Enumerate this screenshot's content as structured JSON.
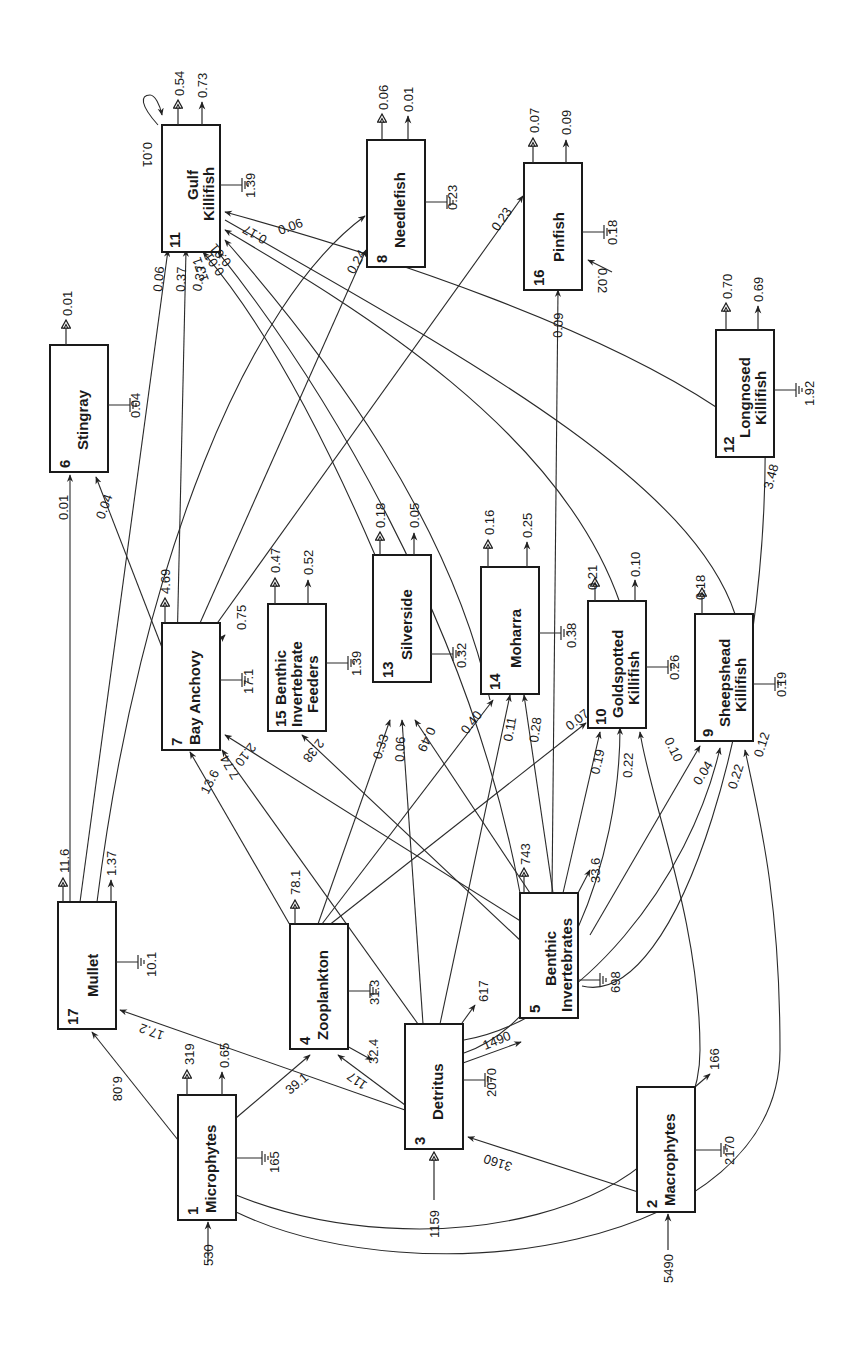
{
  "diagram": {
    "title": "",
    "orientation": "rotated -90deg",
    "compartments": [
      {
        "id": 1,
        "name": [
          "Microphytes"
        ],
        "import": "530",
        "export": "319",
        "other_out": "0.65",
        "respiration": "165"
      },
      {
        "id": 2,
        "name": [
          "Macrophytes"
        ],
        "import": "5490",
        "export": "",
        "other_out": "166",
        "respiration": "2170"
      },
      {
        "id": 3,
        "name": [
          "Detritus"
        ],
        "import": "1159",
        "export": "",
        "other_out": "617",
        "respiration": "2070"
      },
      {
        "id": 4,
        "name": [
          "Zooplankton"
        ],
        "import": "",
        "export": "78.1",
        "other_out": "32.4",
        "respiration": "31.3"
      },
      {
        "id": 5,
        "name": [
          "Benthic",
          "Invertebrates"
        ],
        "import": "",
        "export": "743",
        "other_out": "33.6",
        "respiration": "698"
      },
      {
        "id": 6,
        "name": [
          "Stingray"
        ],
        "import": "",
        "export": "0.01",
        "other_out": "",
        "respiration": "0.04"
      },
      {
        "id": 7,
        "name": [
          "Bay Anchovy"
        ],
        "import": "",
        "export": "4.69",
        "other_out": "0.75",
        "respiration": "17.1"
      },
      {
        "id": 8,
        "name": [
          "Needlefish"
        ],
        "import": "",
        "export": "0.06",
        "other_out": "0.01",
        "respiration": "0.23"
      },
      {
        "id": 9,
        "name": [
          "Sheepshead",
          "Killifish"
        ],
        "import": "",
        "export": "0.18",
        "other_out": "",
        "respiration": "0.19"
      },
      {
        "id": 10,
        "name": [
          "Goldspotted",
          "Killifish"
        ],
        "import": "",
        "export": "0.21",
        "other_out": "0.10",
        "respiration": "0.26"
      },
      {
        "id": 11,
        "name": [
          "Gulf",
          "Killifish"
        ],
        "import": "",
        "export": "0.54",
        "other_out": "0.73",
        "respiration": "1.39",
        "self_loop": "0.01"
      },
      {
        "id": 12,
        "name": [
          "Longnosed",
          "Killifish"
        ],
        "import": "",
        "export": "0.70",
        "other_out": "0.69",
        "respiration": "1.92"
      },
      {
        "id": 13,
        "name": [
          "Silverside"
        ],
        "import": "",
        "export": "0.18",
        "other_out": "0.05",
        "respiration": "0.32"
      },
      {
        "id": 14,
        "name": [
          "Moharra"
        ],
        "import": "",
        "export": "0.16",
        "other_out": "0.25",
        "respiration": "0.38"
      },
      {
        "id": 15,
        "name": [
          "Benthic",
          "Invertebrate",
          "Feeders"
        ],
        "import": "",
        "export": "0.47",
        "other_out": "0.52",
        "respiration": "1.39"
      },
      {
        "id": 16,
        "name": [
          "Pinfish"
        ],
        "import": "0.02",
        "export": "0.07",
        "other_out": "0.09",
        "respiration": "0.18"
      },
      {
        "id": 17,
        "name": [
          "Mullet"
        ],
        "import": "",
        "export": "11.6",
        "other_out": "1.37",
        "respiration": "10.1"
      }
    ],
    "flows": [
      {
        "from": 1,
        "to": 17,
        "value": "6.08"
      },
      {
        "from": 1,
        "to": 4,
        "value": "39.1"
      },
      {
        "from": 2,
        "to": 3,
        "value": "3160"
      },
      {
        "from": 3,
        "to": 17,
        "value": "17.2"
      },
      {
        "from": 3,
        "to": 4,
        "value": "117"
      },
      {
        "from": 3,
        "to": 5,
        "value": "1490"
      },
      {
        "from": 3,
        "to": 7,
        "value": "7.74"
      },
      {
        "from": 3,
        "to": 13,
        "value": "0.06"
      },
      {
        "from": 3,
        "to": 14,
        "value": "0.11"
      },
      {
        "from": 3,
        "to": 10,
        "value": "0.22"
      },
      {
        "from": 3,
        "to": 9,
        "value": "0.22"
      },
      {
        "from": 3,
        "to": 16,
        "value": "0.09"
      },
      {
        "from": 4,
        "to": 7,
        "value": "13.6"
      },
      {
        "from": 4,
        "to": 13,
        "value": "0.33"
      },
      {
        "from": 4,
        "to": 14,
        "value": "0.40"
      },
      {
        "from": 4,
        "to": 10,
        "value": "0.07"
      },
      {
        "from": 5,
        "to": 7,
        "value": "2.10"
      },
      {
        "from": 5,
        "to": 15,
        "value": "2.38"
      },
      {
        "from": 5,
        "to": 13,
        "value": "0.49"
      },
      {
        "from": 5,
        "to": 14,
        "value": "0.28"
      },
      {
        "from": 5,
        "to": 10,
        "value": "0.19"
      },
      {
        "from": 5,
        "to": 9,
        "value": "0.04"
      },
      {
        "from": 5,
        "to": 12,
        "value": "3.48"
      },
      {
        "from": 5,
        "to": 11,
        "value": "1.71"
      },
      {
        "from": 1,
        "to": 10,
        "value": "0.10"
      },
      {
        "from": 1,
        "to": 9,
        "value": "0.12"
      },
      {
        "from": 17,
        "to": 6,
        "value": "0.01"
      },
      {
        "from": 7,
        "to": 6,
        "value": "0.04"
      },
      {
        "from": 17,
        "to": 11,
        "value": "0.06"
      },
      {
        "from": 7,
        "to": 11,
        "value": "0.37"
      },
      {
        "from": 13,
        "to": 11,
        "value": "0.33"
      },
      {
        "from": 14,
        "to": 11,
        "value": "0.01"
      },
      {
        "from": 10,
        "to": 11,
        "value": "0.01"
      },
      {
        "from": 12,
        "to": 11,
        "value": "0.17"
      },
      {
        "from": 17,
        "to": 8,
        "value": "0.06"
      },
      {
        "from": 7,
        "to": 8,
        "value": "0.24"
      },
      {
        "from": 7,
        "to": 16,
        "value": "0.23"
      }
    ],
    "legend_symbols": {
      "export": "double-open-arrow",
      "other_out": "single-arrow",
      "respiration": "ground-symbol"
    }
  }
}
